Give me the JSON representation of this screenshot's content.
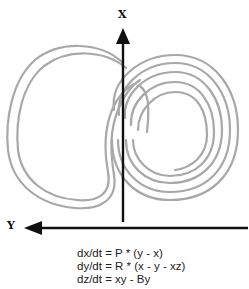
{
  "diagram": {
    "axes": {
      "x_label": "X",
      "y_label": "Y"
    },
    "curve_color": "#a8a8a8",
    "axis_color": "#111111"
  },
  "equations": [
    "dx/dt = P * (y - x)",
    "dy/dt = R * (x - y - xz)",
    "dz/dt = xy - By"
  ]
}
